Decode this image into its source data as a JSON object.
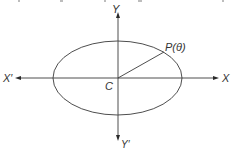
{
  "figure": {
    "stroke_color": "#3a3a3a",
    "background_color": "#ffffff"
  },
  "labels": {
    "y_positive": "Y",
    "y_negative": "Y′",
    "x_positive": "X",
    "x_negative": "X′",
    "center": "C",
    "point": "P(θ)"
  }
}
